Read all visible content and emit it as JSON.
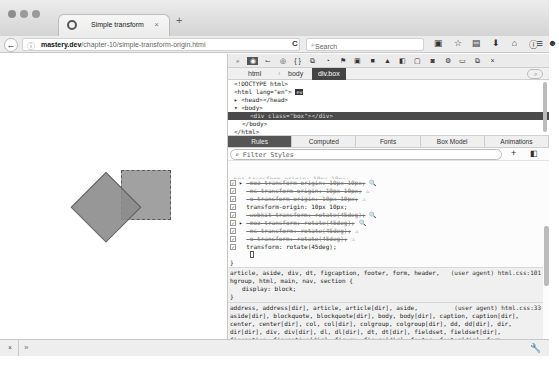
{
  "browser": {
    "tab_title": "Simple transform",
    "tab_close": "×",
    "new_tab": "+",
    "url_domain": "mastery.dev",
    "url_path": "/chapter-10/simple-transform-origin.html",
    "search_placeholder": "Search",
    "back": "←",
    "info": "ⓘ",
    "reload": "C",
    "menu": "≡",
    "nav_icons": [
      "▣",
      "☆",
      "▤",
      "⬇",
      "⌂",
      "ⓘ",
      "☻"
    ]
  },
  "devtools": {
    "toolbar_icons": [
      "⌕",
      "◉",
      "⌙",
      "◎",
      "{ }",
      "⧉",
      "◔",
      "⚑",
      "▣",
      "■",
      "▲",
      "◧",
      "▢",
      "◙",
      "⚙",
      "▭",
      "⧉",
      "×"
    ],
    "breadcrumbs": [
      "html",
      "body",
      "div.box"
    ],
    "markup": [
      "<!DOCTYPE html>",
      "<html lang=\"en\">",
      "▸ <head></head>",
      "▾ <body>",
      "<div class=\"box\"></div>",
      "</body>",
      "</html>"
    ],
    "markup_event_badge": "ev",
    "tabs": [
      "Rules",
      "Computed",
      "Fonts",
      "Box Model",
      "Animations"
    ],
    "filter_placeholder": "Filter Styles",
    "add_rule": "+",
    "declarations": [
      {
        "text": "-moz-transform-origin: 10px 10px;",
        "strike": true,
        "expander": true,
        "icon": "🔍"
      },
      {
        "text": "-ms-transform-origin: 10px 10px;",
        "strike": true,
        "expander": false,
        "icon": "⚠"
      },
      {
        "text": "-o-transform-origin: 10px 10px;",
        "strike": true,
        "expander": false,
        "icon": "⚠"
      },
      {
        "text": "transform-origin: 10px 10px;",
        "strike": false,
        "expander": false,
        "icon": ""
      },
      {
        "text": "-webkit-transform: rotate(45deg);",
        "strike": true,
        "expander": false,
        "icon": "🔍"
      },
      {
        "text": "-moz-transform: rotate(45deg);",
        "strike": true,
        "expander": true,
        "icon": "🔍"
      },
      {
        "text": "-ms-transform: rotate(45deg);",
        "strike": true,
        "expander": false,
        "icon": "⚠"
      },
      {
        "text": "-o-transform: rotate(45deg);",
        "strike": true,
        "expander": false,
        "icon": "⚠"
      },
      {
        "text": "transform: rotate(45deg);",
        "strike": false,
        "expander": false,
        "icon": ""
      }
    ],
    "close_brace": "}",
    "ua_rules": [
      {
        "selector": "article, aside, div, dt, figcaption, footer, form, header, hgroup, html, main, nav, section",
        "source": "(user agent) html.css:101",
        "body": "display: block;"
      },
      {
        "selector": "address, address[dir], article, article[dir], aside, aside[dir], blockquote, blockquote[dir], body, body[dir], caption, caption[dir], center, center[dir], col, col[dir], colgroup, colgroup[dir], dd, dd[dir], dir, dir[dir], div, div[dir], dl, dl[dir], dt, dt[dir], fieldset, fieldset[dir], figcaption, figcaption[dir], figure, figure[dir], footer, footer[dir], form, form[dir], h1, h1[dir], h2, h2[dir], h3, h3[dir], h4, h4[dir], h5, h5[dir], h6, h6[dir], header, header[dir], hgroup, hgroup[dir], hr, hr[dir], html, html[dir], legend, legend[dir], li, li[dir], listing, listing[dir], main, main[dir], marquee,",
        "source": "(user agent) html.css:33"
      }
    ]
  },
  "statusbar": {
    "close": "×",
    "prompt": "»",
    "wrench": "🔧"
  }
}
